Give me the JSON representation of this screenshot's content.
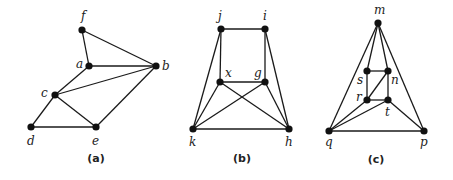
{
  "figure": {
    "graphs": [
      {
        "id": "a",
        "caption": "(a)",
        "caption_pos": [
          96,
          162
        ],
        "vertices": [
          {
            "name": "f",
            "x": 82,
            "y": 30,
            "lx": 81,
            "ly": 20
          },
          {
            "name": "a",
            "x": 89,
            "y": 66,
            "lx": 76,
            "ly": 68
          },
          {
            "name": "b",
            "x": 156,
            "y": 66,
            "lx": 162,
            "ly": 70
          },
          {
            "name": "c",
            "x": 55,
            "y": 95,
            "lx": 41,
            "ly": 97
          },
          {
            "name": "d",
            "x": 31,
            "y": 127,
            "lx": 27,
            "ly": 145
          },
          {
            "name": "e",
            "x": 96,
            "y": 127,
            "lx": 92,
            "ly": 145
          }
        ],
        "edges": [
          [
            "f",
            "a"
          ],
          [
            "f",
            "b"
          ],
          [
            "a",
            "b"
          ],
          [
            "a",
            "c"
          ],
          [
            "c",
            "b"
          ],
          [
            "c",
            "d"
          ],
          [
            "c",
            "e"
          ],
          [
            "d",
            "e"
          ],
          [
            "e",
            "b"
          ]
        ]
      },
      {
        "id": "b",
        "caption": "(b)",
        "caption_pos": [
          242,
          162
        ],
        "vertices": [
          {
            "name": "j",
            "x": 221,
            "y": 29,
            "lx": 218,
            "ly": 20
          },
          {
            "name": "i",
            "x": 265,
            "y": 29,
            "lx": 263,
            "ly": 20
          },
          {
            "name": "x",
            "x": 220,
            "y": 82,
            "lx": 225,
            "ly": 77
          },
          {
            "name": "g",
            "x": 265,
            "y": 82,
            "lx": 254,
            "ly": 77
          },
          {
            "name": "k",
            "x": 193,
            "y": 129,
            "lx": 189,
            "ly": 146
          },
          {
            "name": "h",
            "x": 289,
            "y": 129,
            "lx": 285,
            "ly": 146
          }
        ],
        "edges": [
          [
            "j",
            "i"
          ],
          [
            "j",
            "x"
          ],
          [
            "i",
            "g"
          ],
          [
            "x",
            "g"
          ],
          [
            "j",
            "k"
          ],
          [
            "i",
            "h"
          ],
          [
            "x",
            "k"
          ],
          [
            "x",
            "h"
          ],
          [
            "g",
            "k"
          ],
          [
            "g",
            "h"
          ],
          [
            "k",
            "h"
          ]
        ]
      },
      {
        "id": "c",
        "caption": "(c)",
        "caption_pos": [
          376,
          163
        ],
        "vertices": [
          {
            "name": "m",
            "x": 378,
            "y": 23,
            "lx": 374,
            "ly": 14
          },
          {
            "name": "s",
            "x": 367,
            "y": 71,
            "lx": 357,
            "ly": 84
          },
          {
            "name": "n",
            "x": 388,
            "y": 71,
            "lx": 391,
            "ly": 84
          },
          {
            "name": "r",
            "x": 367,
            "y": 100,
            "lx": 356,
            "ly": 101
          },
          {
            "name": "t",
            "x": 388,
            "y": 100,
            "lx": 385,
            "ly": 116
          },
          {
            "name": "q",
            "x": 329,
            "y": 131,
            "lx": 325,
            "ly": 146
          },
          {
            "name": "p",
            "x": 424,
            "y": 131,
            "lx": 420,
            "ly": 146
          }
        ],
        "edges": [
          [
            "m",
            "q"
          ],
          [
            "m",
            "p"
          ],
          [
            "m",
            "s"
          ],
          [
            "m",
            "n"
          ],
          [
            "s",
            "n"
          ],
          [
            "s",
            "r"
          ],
          [
            "n",
            "t"
          ],
          [
            "r",
            "t"
          ],
          [
            "r",
            "n"
          ],
          [
            "r",
            "q"
          ],
          [
            "t",
            "q"
          ],
          [
            "t",
            "p"
          ],
          [
            "q",
            "p"
          ]
        ]
      }
    ]
  }
}
